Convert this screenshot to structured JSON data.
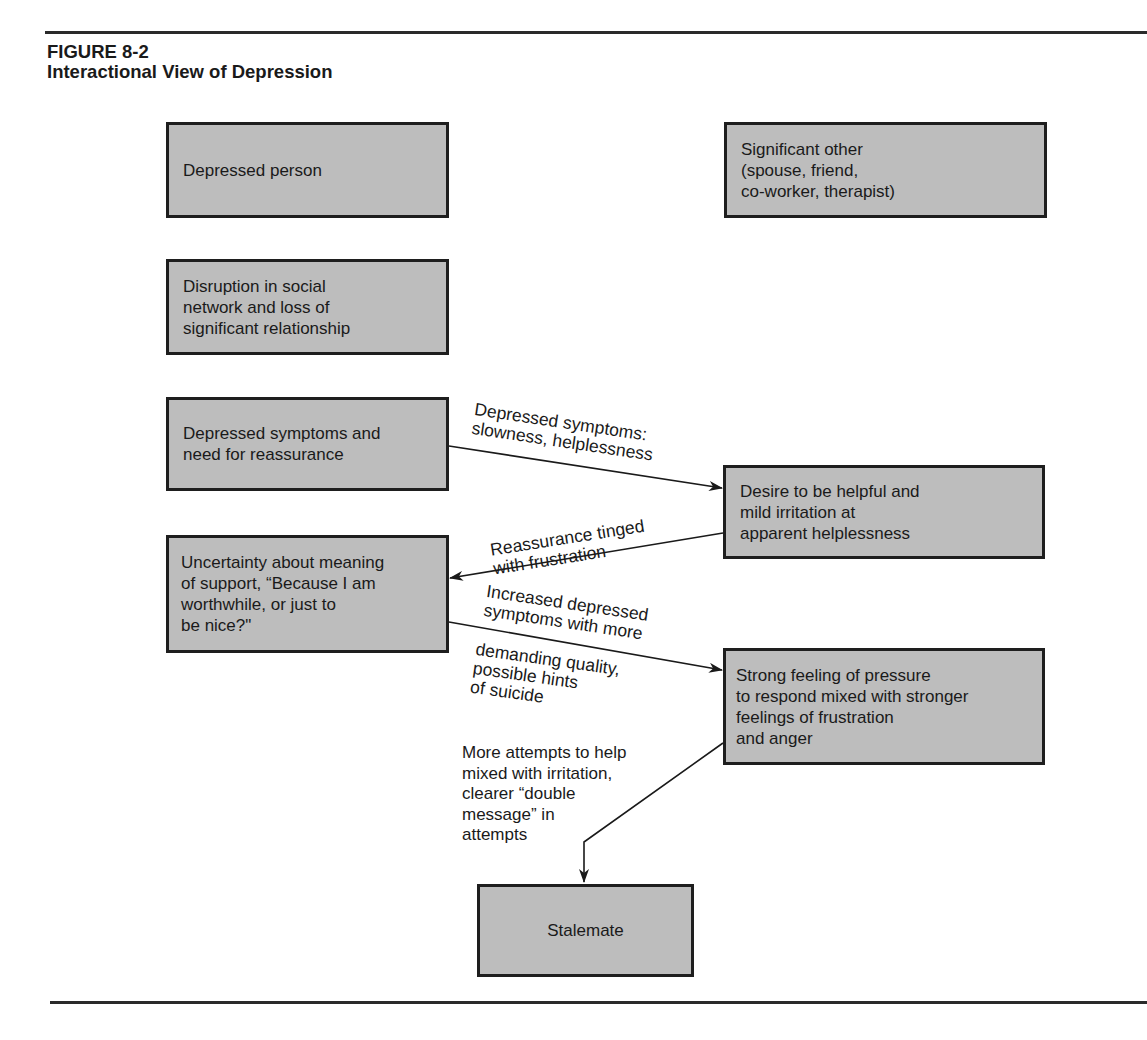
{
  "figure": {
    "number": "FIGURE 8-2",
    "title": "Interactional View of Depression"
  },
  "nodes": {
    "depressed_person": "Depressed person",
    "significant_other": "Significant other\n(spouse, friend,\nco-worker, therapist)",
    "disruption": "Disruption in social\nnetwork and loss of\nsignificant relationship",
    "depressed_symptoms": "Depressed symptoms and\nneed for reassurance",
    "uncertainty": "Uncertainty about meaning\nof support, “Because I am\nworthwhile, or just to\nbe nice?\"",
    "desire_to_help": "Desire to be helpful and\nmild irritation at\napparent helplessness",
    "strong_feeling": "Strong feeling of pressure\nto respond mixed with stronger\nfeelings of frustration\nand anger",
    "stalemate": "Stalemate"
  },
  "edges": {
    "e1_label": "Depressed symptoms:\nslowness, helplessness",
    "e2_label": "Reassurance tinged\nwith frustration",
    "e3_label_above": "Increased depressed\nsymptoms with more",
    "e3_label_below": "demanding quality,\npossible hints\nof suicide",
    "e4_label": "More attempts to help\nmixed with irritation,\nclearer “double\nmessage” in\nattempts"
  },
  "colors": {
    "box_fill": "#bdbdbd",
    "box_border": "#1e1e1e",
    "rule": "#2a2a2a"
  }
}
